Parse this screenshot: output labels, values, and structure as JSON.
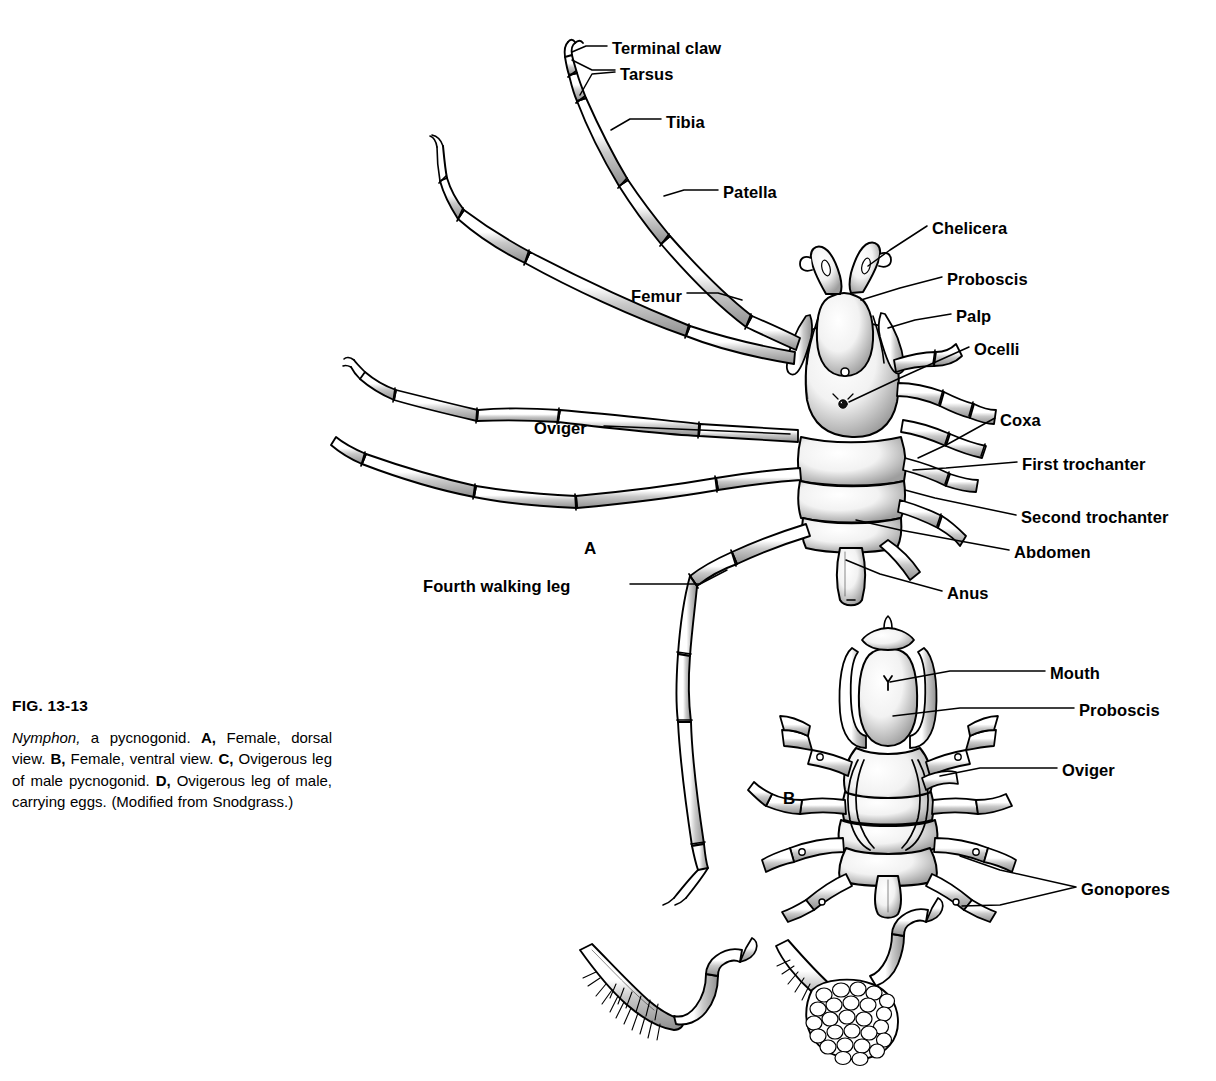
{
  "figure": {
    "number": "FIG. 13-13",
    "caption_parts": [
      {
        "text": "Nymphon,",
        "style": "italic"
      },
      {
        "text": " a pycnogonid. ",
        "style": "normal"
      },
      {
        "text": "A,",
        "style": "bold"
      },
      {
        "text": " Female, dorsal view. ",
        "style": "normal"
      },
      {
        "text": "B,",
        "style": "bold"
      },
      {
        "text": " Female, ventral view. ",
        "style": "normal"
      },
      {
        "text": "C,",
        "style": "bold"
      },
      {
        "text": " Ovigerous leg of male pycnogonid. ",
        "style": "normal"
      },
      {
        "text": "D,",
        "style": "bold"
      },
      {
        "text": " Ovigerous leg of male, carrying eggs. (Modified from Snodgrass.)",
        "style": "normal"
      }
    ],
    "caption_plain": "Nymphon, a pycnogonid. A, Female, dorsal view. B, Female, ventral view. C, Ovigerous leg of male pycnogonid. D, Ovigerous leg of male, carrying eggs. (Modified from Snodgrass.)",
    "organism": "Nymphon",
    "ink_color": "#000000",
    "background_color": "#ffffff"
  },
  "panels": [
    {
      "id": "A",
      "letter": "A",
      "x": 584,
      "y": 540,
      "view": "Female, dorsal view"
    },
    {
      "id": "B",
      "letter": "B",
      "x": 783,
      "y": 790,
      "view": "Female, ventral view"
    }
  ],
  "labels_panel_a": [
    {
      "key": "terminal_claw",
      "text": "Terminal claw",
      "x": 612,
      "y": 40,
      "align": "left"
    },
    {
      "key": "tarsus",
      "text": "Tarsus",
      "x": 620,
      "y": 66,
      "align": "left"
    },
    {
      "key": "tibia",
      "text": "Tibia",
      "x": 666,
      "y": 114,
      "align": "left"
    },
    {
      "key": "patella",
      "text": "Patella",
      "x": 723,
      "y": 184,
      "align": "left"
    },
    {
      "key": "chelicera",
      "text": "Chelicera",
      "x": 932,
      "y": 220,
      "align": "left"
    },
    {
      "key": "proboscis",
      "text": "Proboscis",
      "x": 947,
      "y": 271,
      "align": "left"
    },
    {
      "key": "palp",
      "text": "Palp",
      "x": 956,
      "y": 308,
      "align": "left"
    },
    {
      "key": "ocelli",
      "text": "Ocelli",
      "x": 974,
      "y": 341,
      "align": "left"
    },
    {
      "key": "femur",
      "text": "Femur",
      "x": 631,
      "y": 288,
      "align": "left"
    },
    {
      "key": "oviger",
      "text": "Oviger",
      "x": 534,
      "y": 420,
      "align": "left"
    },
    {
      "key": "coxa",
      "text": "Coxa",
      "x": 1000,
      "y": 412,
      "align": "left"
    },
    {
      "key": "first_trochanter",
      "text": "First trochanter",
      "x": 1022,
      "y": 456,
      "align": "left"
    },
    {
      "key": "second_trochanter",
      "text": "Second trochanter",
      "x": 1021,
      "y": 509,
      "align": "left"
    },
    {
      "key": "abdomen",
      "text": "Abdomen",
      "x": 1014,
      "y": 544,
      "align": "left"
    },
    {
      "key": "anus",
      "text": "Anus",
      "x": 947,
      "y": 585,
      "align": "left"
    },
    {
      "key": "fourth_walking_leg",
      "text": "Fourth walking leg",
      "x": 423,
      "y": 578,
      "align": "left"
    }
  ],
  "labels_panel_b": [
    {
      "key": "mouth",
      "text": "Mouth",
      "x": 1050,
      "y": 665,
      "align": "left"
    },
    {
      "key": "proboscis_b",
      "text": "Proboscis",
      "x": 1079,
      "y": 702,
      "align": "left"
    },
    {
      "key": "oviger_b",
      "text": "Oviger",
      "x": 1062,
      "y": 762,
      "align": "left"
    },
    {
      "key": "gonopores",
      "text": "Gonopores",
      "x": 1081,
      "y": 881,
      "align": "left"
    }
  ],
  "sub_figures": [
    {
      "id": "C",
      "description": "Ovigerous leg of male pycnogonid, with setae",
      "x": 650,
      "y": 1010
    },
    {
      "id": "D",
      "description": "Ovigerous leg of male, carrying eggs",
      "x": 855,
      "y": 1010
    }
  ]
}
